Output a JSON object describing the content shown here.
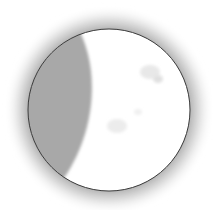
{
  "figure": {
    "phase": "waxing gibbous",
    "colors": {
      "background": "#ffffff",
      "halo": "#9a9a9a",
      "lit_surface": "#ffffff",
      "shadow": "#a8a8a8",
      "outline": "#3a3a3a",
      "crater": "#e6e6e6"
    }
  }
}
